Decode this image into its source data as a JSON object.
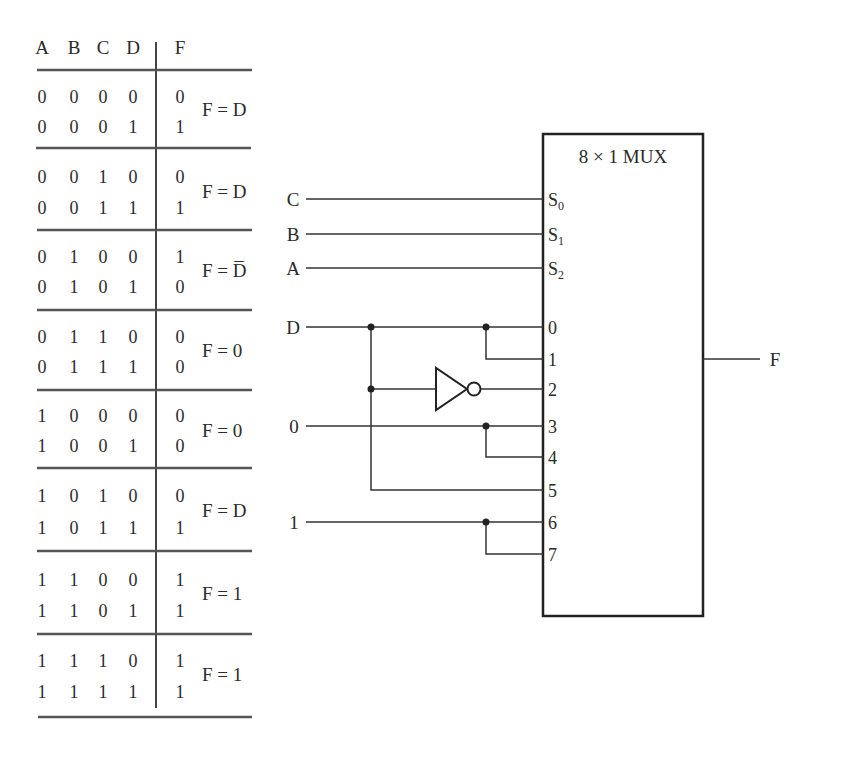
{
  "truth_table": {
    "headers": [
      "A",
      "B",
      "C",
      "D",
      "F"
    ],
    "groups": [
      {
        "rows": [
          [
            "0",
            "0",
            "0",
            "0",
            "0"
          ],
          [
            "0",
            "0",
            "0",
            "1",
            "1"
          ]
        ],
        "expression": "F = D"
      },
      {
        "rows": [
          [
            "0",
            "0",
            "1",
            "0",
            "0"
          ],
          [
            "0",
            "0",
            "1",
            "1",
            "1"
          ]
        ],
        "expression": "F = D"
      },
      {
        "rows": [
          [
            "0",
            "1",
            "0",
            "0",
            "1"
          ],
          [
            "0",
            "1",
            "0",
            "1",
            "0"
          ]
        ],
        "expression": "F = D̅"
      },
      {
        "rows": [
          [
            "0",
            "1",
            "1",
            "0",
            "0"
          ],
          [
            "0",
            "1",
            "1",
            "1",
            "0"
          ]
        ],
        "expression": "F = 0"
      },
      {
        "rows": [
          [
            "1",
            "0",
            "0",
            "0",
            "0"
          ],
          [
            "1",
            "0",
            "0",
            "1",
            "0"
          ]
        ],
        "expression": "F = 0"
      },
      {
        "rows": [
          [
            "1",
            "0",
            "1",
            "0",
            "0"
          ],
          [
            "1",
            "0",
            "1",
            "1",
            "1"
          ]
        ],
        "expression": "F = D"
      },
      {
        "rows": [
          [
            "1",
            "1",
            "0",
            "0",
            "1"
          ],
          [
            "1",
            "1",
            "0",
            "1",
            "1"
          ]
        ],
        "expression": "F = 1"
      },
      {
        "rows": [
          [
            "1",
            "1",
            "1",
            "0",
            "1"
          ],
          [
            "1",
            "1",
            "1",
            "1",
            "1"
          ]
        ],
        "expression": "F = 1"
      }
    ]
  },
  "mux": {
    "title": "8 × 1 MUX",
    "select_pins": [
      {
        "label": "S",
        "sub": "0",
        "input": "C"
      },
      {
        "label": "S",
        "sub": "1",
        "input": "B"
      },
      {
        "label": "S",
        "sub": "2",
        "input": "A"
      }
    ],
    "data_pins": [
      {
        "label": "0",
        "source": "D"
      },
      {
        "label": "1",
        "source": "D"
      },
      {
        "label": "2",
        "source": "D'"
      },
      {
        "label": "3",
        "source": "0"
      },
      {
        "label": "4",
        "source": "0"
      },
      {
        "label": "5",
        "source": "D"
      },
      {
        "label": "6",
        "source": "1"
      },
      {
        "label": "7",
        "source": "1"
      }
    ],
    "inputs": {
      "D": "D",
      "zero": "0",
      "one": "1"
    },
    "output": "F"
  },
  "colors": {
    "ink": "#2a2a2a",
    "background": "#ffffff"
  }
}
